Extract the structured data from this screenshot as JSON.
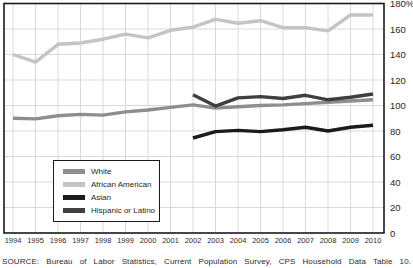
{
  "chart_data": {
    "type": "line",
    "title": "",
    "xlabel": "",
    "ylabel": "",
    "x": [
      1994,
      1995,
      1996,
      1997,
      1998,
      1999,
      2000,
      2001,
      2002,
      2003,
      2004,
      2005,
      2006,
      2007,
      2008,
      2009,
      2010
    ],
    "series": [
      {
        "name": "White",
        "color": "#8e8e8e",
        "values": [
          90,
          89.5,
          92,
          93,
          92.5,
          95,
          96.5,
          98.5,
          100.5,
          98,
          99,
          100,
          100.5,
          101.5,
          102.5,
          103.5,
          104.5
        ]
      },
      {
        "name": "African American",
        "color": "#c4c4c4",
        "values": [
          140,
          134,
          148,
          149,
          152,
          156,
          153,
          159,
          161.5,
          167.5,
          164.5,
          166.5,
          161,
          161,
          158.5,
          171,
          171
        ]
      },
      {
        "name": "Asian",
        "color": "#1b1b1b",
        "values": [
          null,
          null,
          null,
          null,
          null,
          null,
          null,
          null,
          74.5,
          79.5,
          80.5,
          79.5,
          81,
          83,
          80,
          83,
          84.5
        ]
      },
      {
        "name": "Hispanic or Latino",
        "color": "#3f3f3f",
        "values": [
          null,
          null,
          null,
          null,
          null,
          null,
          null,
          null,
          108.5,
          99.5,
          106,
          107,
          105.5,
          108,
          104.5,
          106.5,
          109
        ]
      }
    ],
    "ylim": [
      0,
      180
    ],
    "ytick_interval": 20,
    "yaxis_side": "right",
    "ytick_labels": [
      "180%",
      "160",
      "140",
      "120",
      "100",
      "80",
      "60",
      "40",
      "20",
      "0"
    ],
    "grid": true,
    "grid_color": "#d9d9d9",
    "border_color": "#1a1a1a",
    "legend_position": "lower-left"
  },
  "source_note": "SOURCE: Bureau of Labor Statistics, Current Population Survey, CPS Household Data Table 10."
}
